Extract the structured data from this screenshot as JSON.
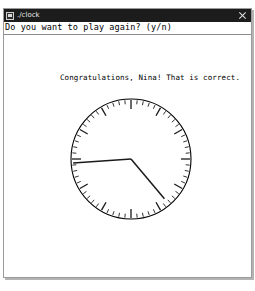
{
  "window": {
    "title": "./clock",
    "system_icon": "window-system-icon",
    "close_icon": "close-icon"
  },
  "terminal": {
    "prompt_line": "Do you want to play again? (y/n)",
    "congrats_line": "Congratulations, Nina! That is correct.",
    "foreground_color": "#000000",
    "background_color": "#ffffff",
    "titlebar_color": "#1c1c1c",
    "titlebar_text_color": "#e8e8e8"
  },
  "clock": {
    "name": "analog-clock-face",
    "center_x": 65,
    "center_y": 65,
    "radius": 60,
    "rim_color": "#000000",
    "tick_color": "#1a1a1a",
    "hand_color": "#1a1a1a",
    "minute_tick_count": 60,
    "hour_tick_count": 12,
    "minute_tick_length": 5,
    "hour_tick_length": 10,
    "hour_hand": {
      "label": "hour-hand",
      "angle_deg": 140,
      "length": 52
    },
    "minute_hand": {
      "label": "minute-hand",
      "angle_deg": 266,
      "length": 58
    },
    "reading": "4:45"
  }
}
